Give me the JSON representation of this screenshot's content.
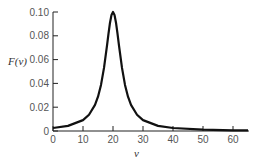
{
  "chart_data": {
    "type": "line",
    "title": "",
    "xlabel": "ν",
    "ylabel": "F(ν)",
    "xlim": [
      0,
      65
    ],
    "ylim": [
      0,
      0.1
    ],
    "grid": false,
    "legend": null,
    "x_ticks": [
      0,
      10,
      20,
      30,
      40,
      50,
      60
    ],
    "x_tick_labels": [
      "0",
      "10",
      "20",
      "30",
      "40",
      "50",
      "60"
    ],
    "y_ticks": [
      0,
      0.02,
      0.04,
      0.06,
      0.08,
      0.1
    ],
    "y_tick_labels": [
      "0",
      "0.02",
      "0.04",
      "0.06",
      "0.08",
      "0.10"
    ],
    "series": [
      {
        "name": "F(ν)",
        "color": "#111111",
        "description": "Sharp single peak (Lorentzian-like) centered at ν = 20 with maximum ≈ 0.10",
        "x": [
          0,
          5,
          10,
          12,
          14,
          15,
          16,
          17,
          18,
          18.5,
          19,
          19.5,
          20,
          20.5,
          21,
          21.5,
          22,
          23,
          24,
          25,
          26,
          28,
          30,
          35,
          40,
          50,
          60,
          65
        ],
        "y": [
          0.0025,
          0.0043,
          0.0092,
          0.0137,
          0.0219,
          0.0288,
          0.0387,
          0.053,
          0.0717,
          0.0818,
          0.091,
          0.0976,
          0.1,
          0.0976,
          0.091,
          0.0818,
          0.0717,
          0.053,
          0.0387,
          0.0288,
          0.0219,
          0.0137,
          0.0092,
          0.0043,
          0.0025,
          0.0011,
          0.0006,
          0.0005
        ]
      }
    ]
  }
}
